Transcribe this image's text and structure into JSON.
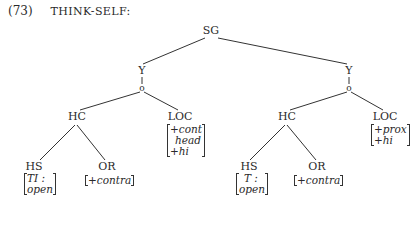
{
  "example": {
    "number": "(73)",
    "title": "THINK-SELF:"
  },
  "tree": {
    "root": "SG",
    "left": {
      "y": "Y",
      "circle": "o",
      "hc": "HC",
      "loc": "LOC",
      "loc_features": [
        "+cont",
        "head",
        "+hi"
      ],
      "hs": "HS",
      "hs_features": [
        "TI :",
        "open"
      ],
      "or": "OR",
      "or_features": [
        "+contra"
      ]
    },
    "right": {
      "y": "Y",
      "circle": "o",
      "hc": "HC",
      "loc": "LOC",
      "loc_features": [
        "+prox",
        "+hi"
      ],
      "hs": "HS",
      "hs_features": [
        "T :",
        "open"
      ],
      "or": "OR",
      "or_features": [
        "+contra"
      ]
    }
  }
}
